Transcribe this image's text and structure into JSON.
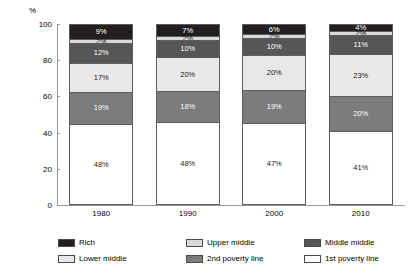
{
  "chart_data": {
    "type": "bar",
    "subtype": "stacked-column",
    "title": "",
    "xlabel": "",
    "ylabel": "%",
    "ylim": [
      0,
      100
    ],
    "yticks": [
      "0",
      "20",
      "40",
      "60",
      "80",
      "100"
    ],
    "grid": false,
    "legend_position": "bottom",
    "categories": [
      "1980",
      "1990",
      "2000",
      "2010"
    ],
    "series": [
      {
        "name": "1st poverty line",
        "color": "#ffffff",
        "values": [
          48,
          48,
          47,
          41
        ],
        "labels": [
          "48%",
          "48%",
          "47%",
          "41%"
        ]
      },
      {
        "name": "2nd poverty line",
        "color": "#7c7c7c",
        "values": [
          19,
          18,
          19,
          20
        ],
        "labels": [
          "19%",
          "18%",
          "19%",
          "20%"
        ]
      },
      {
        "name": "Lower middle",
        "color": "#e8e8e8",
        "values": [
          17,
          20,
          20,
          23
        ],
        "labels": [
          "17%",
          "20%",
          "20%",
          "23%"
        ]
      },
      {
        "name": "Middle middle",
        "color": "#565656",
        "values": [
          12,
          10,
          10,
          11
        ],
        "labels": [
          "12%",
          "10%",
          "10%",
          "11%"
        ]
      },
      {
        "name": "Upper middle",
        "color": "#d9d9d9",
        "values": [
          2,
          2,
          2,
          2
        ],
        "labels": [
          "2%",
          "2%",
          "2%",
          "2%"
        ]
      },
      {
        "name": "Rich",
        "color": "#231f20",
        "values": [
          9,
          7,
          6,
          4
        ],
        "labels": [
          "9%",
          "7%",
          "6%",
          "4%"
        ]
      }
    ]
  },
  "axis": {
    "unit_label": "%",
    "yticks": [
      "100",
      "80",
      "60",
      "40",
      "20",
      "0"
    ],
    "xticks": [
      "1980",
      "1990",
      "2000",
      "2010"
    ]
  },
  "legend": {
    "items": [
      {
        "label": "Rich",
        "color": "#231f20"
      },
      {
        "label": "Upper middle",
        "color": "#d9d9d9"
      },
      {
        "label": "Middle middle",
        "color": "#565656"
      },
      {
        "label": "Lower middle",
        "color": "#e8e8e8"
      },
      {
        "label": "2nd poverty line",
        "color": "#7c7c7c"
      },
      {
        "label": "1st poverty line",
        "color": "#ffffff"
      }
    ]
  },
  "bars": [
    {
      "category": "1980",
      "segments": [
        {
          "series": "Rich",
          "label": "9%",
          "fill": "f-rich"
        },
        {
          "series": "Upper middle",
          "label": "2%",
          "fill": "f-upper"
        },
        {
          "series": "Middle middle",
          "label": "12%",
          "fill": "f-middle"
        },
        {
          "series": "Lower middle",
          "label": "17%",
          "fill": "f-lower"
        },
        {
          "series": "2nd poverty line",
          "label": "19%",
          "fill": "f-pov2"
        },
        {
          "series": "1st poverty line",
          "label": "48%",
          "fill": "f-pov1"
        }
      ]
    },
    {
      "category": "1990",
      "segments": [
        {
          "series": "Rich",
          "label": "7%",
          "fill": "f-rich"
        },
        {
          "series": "Upper middle",
          "label": "2%",
          "fill": "f-upper"
        },
        {
          "series": "Middle middle",
          "label": "10%",
          "fill": "f-middle"
        },
        {
          "series": "Lower middle",
          "label": "20%",
          "fill": "f-lower"
        },
        {
          "series": "2nd poverty line",
          "label": "18%",
          "fill": "f-pov2"
        },
        {
          "series": "1st poverty line",
          "label": "48%",
          "fill": "f-pov1"
        }
      ]
    },
    {
      "category": "2000",
      "segments": [
        {
          "series": "Rich",
          "label": "6%",
          "fill": "f-rich"
        },
        {
          "series": "Upper middle",
          "label": "2%",
          "fill": "f-upper"
        },
        {
          "series": "Middle middle",
          "label": "10%",
          "fill": "f-middle"
        },
        {
          "series": "Lower middle",
          "label": "20%",
          "fill": "f-lower"
        },
        {
          "series": "2nd poverty line",
          "label": "19%",
          "fill": "f-pov2"
        },
        {
          "series": "1st poverty line",
          "label": "47%",
          "fill": "f-pov1"
        }
      ]
    },
    {
      "category": "2010",
      "segments": [
        {
          "series": "Rich",
          "label": "4%",
          "fill": "f-rich"
        },
        {
          "series": "Upper middle",
          "label": "2%",
          "fill": "f-upper"
        },
        {
          "series": "Middle middle",
          "label": "11%",
          "fill": "f-middle"
        },
        {
          "series": "Lower middle",
          "label": "23%",
          "fill": "f-lower"
        },
        {
          "series": "2nd poverty line",
          "label": "20%",
          "fill": "f-pov2"
        },
        {
          "series": "1st poverty line",
          "label": "41%",
          "fill": "f-pov1"
        }
      ]
    }
  ]
}
